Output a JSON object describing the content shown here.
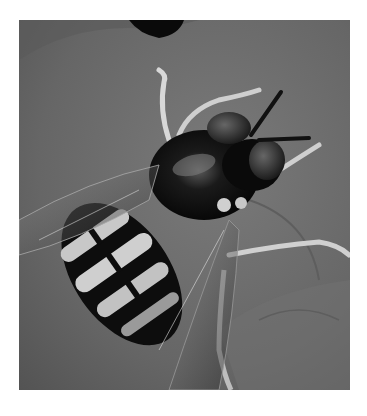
{
  "image": {
    "subject": "hoverfly on leaf",
    "style": "grayscale macro photograph",
    "colors": {
      "page_background": "#ffffff",
      "leaf_mid": "#6b6b6b",
      "leaf_dark": "#4a4a4a",
      "leaf_light": "#8a8a8a",
      "insect_dark": "#0d0d0d",
      "stripe_light": "#c8c8c8"
    }
  }
}
